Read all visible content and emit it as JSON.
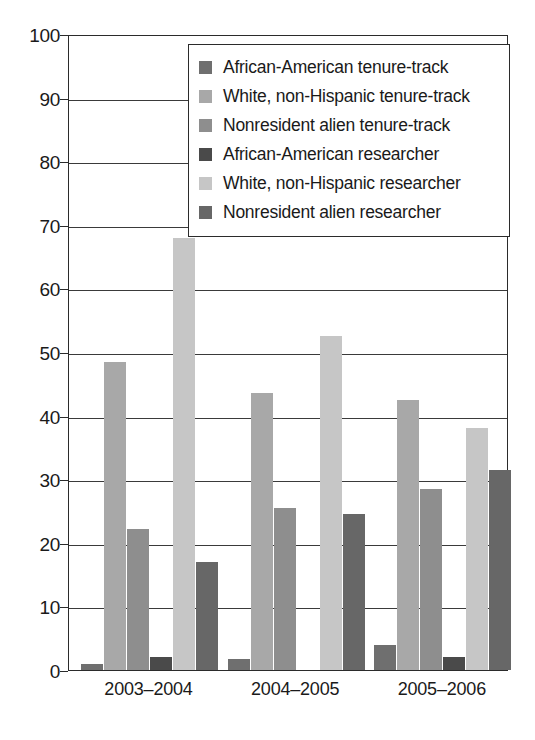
{
  "chart_data": {
    "type": "bar",
    "title": "",
    "subtitle": "",
    "xlabel": "",
    "ylabel": "",
    "ylim": [
      0,
      100
    ],
    "ytick_step": 10,
    "yticks": [
      0,
      10,
      20,
      30,
      40,
      50,
      60,
      70,
      80,
      90,
      100
    ],
    "grid": true,
    "legend_position": "top-center-inside",
    "categories": [
      "2003–2004",
      "2004–2005",
      "2005–2006"
    ],
    "series": [
      {
        "name": "African-American tenure-track",
        "color": "#6f6f6f",
        "values": [
          1.0,
          1.8,
          4.0
        ]
      },
      {
        "name": "White, non-Hispanic tenure-track",
        "color": "#a8a8a8",
        "values": [
          48.5,
          43.5,
          42.5
        ]
      },
      {
        "name": "Nonresident alien tenure-track",
        "color": "#8e8e8e",
        "values": [
          22.2,
          25.5,
          28.4
        ]
      },
      {
        "name": "African-American researcher",
        "color": "#4a4a4a",
        "values": [
          2.0,
          0.0,
          2.0
        ]
      },
      {
        "name": "White, non-Hispanic researcher",
        "color": "#c6c6c6",
        "values": [
          68.0,
          52.5,
          38.0
        ]
      },
      {
        "name": "Nonresident alien researcher",
        "color": "#676767",
        "values": [
          17.0,
          24.5,
          31.4
        ]
      }
    ]
  },
  "axis": {
    "y_tick_labels": [
      "100",
      "90",
      "80",
      "70",
      "60",
      "50",
      "40",
      "30",
      "20",
      "10",
      "0"
    ],
    "x_tick_labels": [
      "2003–2004",
      "2004–2005",
      "2005–2006"
    ]
  },
  "legend": {
    "items": [
      {
        "label": "African-American tenure-track",
        "color": "#6f6f6f"
      },
      {
        "label": "White, non-Hispanic tenure-track",
        "color": "#a8a8a8"
      },
      {
        "label": "Nonresident alien tenure-track",
        "color": "#8e8e8e"
      },
      {
        "label": "African-American researcher",
        "color": "#4a4a4a"
      },
      {
        "label": "White, non-Hispanic researcher",
        "color": "#c6c6c6"
      },
      {
        "label": "Nonresident alien researcher",
        "color": "#676767"
      }
    ]
  },
  "style": {
    "axis_color": "#2b2b2b",
    "grid_color": "#3a3a3a",
    "background": "#ffffff",
    "text_color": "#1a1a1a"
  }
}
